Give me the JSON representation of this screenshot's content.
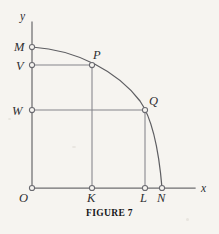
{
  "figure": {
    "caption": "FIGURE 7",
    "background_color": "#f6f4f0",
    "axis_color": "#6e6e70",
    "guide_color": "#83838a",
    "curve_color": "#5e5e62",
    "label_color": "#2e2e30"
  },
  "axes": {
    "x_label": "x",
    "y_label": "y",
    "origin_label": "O",
    "x_axis": {
      "x1": 32,
      "y1": 188,
      "x2": 195,
      "y2": 188
    },
    "y_axis": {
      "x1": 32,
      "y1": 22,
      "x2": 32,
      "y2": 188
    },
    "x_label_pos": {
      "x": 202,
      "y": 191
    },
    "y_label_pos": {
      "x": 21,
      "y": 19
    },
    "origin_label_pos": {
      "x": 19,
      "y": 202
    }
  },
  "points": [
    {
      "id": "O",
      "label": "O",
      "x": 32,
      "y": 188,
      "label_x": 19,
      "label_y": 202,
      "marker": true
    },
    {
      "id": "M",
      "label": "M",
      "x": 32,
      "y": 47,
      "label_x": 14,
      "label_y": 51,
      "marker": true
    },
    {
      "id": "V",
      "label": "V",
      "x": 32,
      "y": 65,
      "label_x": 16,
      "label_y": 70,
      "marker": true
    },
    {
      "id": "W",
      "label": "W",
      "x": 32,
      "y": 110,
      "label_x": 13,
      "label_y": 115,
      "marker": true
    },
    {
      "id": "P",
      "label": "P",
      "x": 92,
      "y": 65,
      "label_x": 93,
      "label_y": 58,
      "marker": true
    },
    {
      "id": "Q",
      "label": "Q",
      "x": 145,
      "y": 110,
      "label_x": 148,
      "label_y": 105,
      "marker": true
    },
    {
      "id": "K",
      "label": "K",
      "x": 92,
      "y": 188,
      "label_x": 88,
      "label_y": 202,
      "marker": true
    },
    {
      "id": "L",
      "label": "L",
      "x": 145,
      "y": 188,
      "label_x": 141,
      "label_y": 202,
      "marker": true
    },
    {
      "id": "N",
      "label": "N",
      "x": 162,
      "y": 188,
      "label_x": 158,
      "label_y": 202,
      "marker": true
    }
  ],
  "guides": [
    {
      "name": "segment-v-to-p",
      "x1": 32,
      "y1": 65,
      "x2": 92,
      "y2": 65
    },
    {
      "name": "segment-w-to-q",
      "x1": 32,
      "y1": 110,
      "x2": 145,
      "y2": 110
    },
    {
      "name": "segment-p-to-k",
      "x1": 92,
      "y1": 65,
      "x2": 92,
      "y2": 188
    },
    {
      "name": "segment-q-to-l",
      "x1": 145,
      "y1": 110,
      "x2": 145,
      "y2": 188
    }
  ],
  "curve": {
    "name": "arc-m-p-q-n",
    "description": "concave-decreasing arc from M on the y-axis through P and Q to N on the x-axis",
    "path": "M 32 47 C 78 50 118 72 140 101 C 152 118 159 152 162 188",
    "endpoints": {
      "start": "M",
      "end": "N"
    },
    "passes_through": [
      "P",
      "Q"
    ]
  }
}
